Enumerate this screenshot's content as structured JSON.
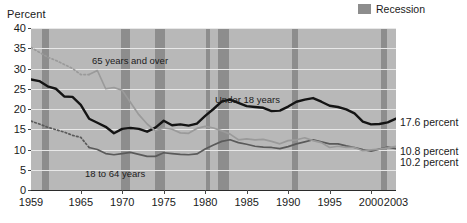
{
  "axis_title": "Percent",
  "legend": {
    "label": "Recession",
    "swatch_color": "#8d8d8d"
  },
  "colors": {
    "plot_background": "#b8b8b8",
    "recession_band": "#8d8d8d",
    "gridline": "#e8e8e8",
    "under18": "#141414",
    "age18to64": "#5a5a5a",
    "age65plus": "#9a9a9a"
  },
  "annotations": [
    {
      "name": "series-label-65-and-over",
      "text": "65 years and over"
    },
    {
      "name": "series-label-under-18",
      "text": "Under 18 years"
    },
    {
      "name": "series-label-18-to-64",
      "text": "18 to 64 years"
    }
  ],
  "end_labels": [
    {
      "name": "end-label-under-18",
      "text": "17.6 percent"
    },
    {
      "name": "end-label-65-and-over",
      "text": "10.8 percent"
    },
    {
      "name": "end-label-18-to-64",
      "text": "10.2 percent"
    }
  ],
  "chart_data": {
    "type": "line",
    "title": "",
    "xlabel": "",
    "ylabel": "Percent",
    "xlim": [
      1959,
      2003
    ],
    "ylim": [
      0,
      40
    ],
    "ytick_labels": [
      "0",
      "5",
      "10",
      "15",
      "20",
      "25",
      "30",
      "35",
      "40"
    ],
    "yticks": [
      0,
      5,
      10,
      15,
      20,
      25,
      30,
      35,
      40
    ],
    "xtick_labels": [
      "1959",
      "1965",
      "1970",
      "1975",
      "1980",
      "1985",
      "1990",
      "1995",
      "2000",
      "2003"
    ],
    "xticks": [
      1959,
      1965,
      1970,
      1975,
      1980,
      1985,
      1990,
      1995,
      2000,
      2003
    ],
    "grid": true,
    "legend_position": "top-right",
    "x": [
      1959,
      1960,
      1961,
      1962,
      1963,
      1964,
      1965,
      1966,
      1967,
      1968,
      1969,
      1970,
      1971,
      1972,
      1973,
      1974,
      1975,
      1976,
      1977,
      1978,
      1979,
      1980,
      1981,
      1982,
      1983,
      1984,
      1985,
      1986,
      1987,
      1988,
      1989,
      1990,
      1991,
      1992,
      1993,
      1994,
      1995,
      1996,
      1997,
      1998,
      1999,
      2000,
      2001,
      2002,
      2003
    ],
    "series": [
      {
        "name": "Under 18 years",
        "color": "#141414",
        "style": "solid",
        "final_value": 17.6,
        "values": [
          27.3,
          26.9,
          25.6,
          25.0,
          23.1,
          23.0,
          21.0,
          17.6,
          16.6,
          15.6,
          14.0,
          15.1,
          15.3,
          15.1,
          14.4,
          15.4,
          17.1,
          16.0,
          16.2,
          15.9,
          16.4,
          18.3,
          20.0,
          21.9,
          22.3,
          21.5,
          20.7,
          20.5,
          20.3,
          19.5,
          19.6,
          20.6,
          21.8,
          22.3,
          22.7,
          21.8,
          20.8,
          20.5,
          19.9,
          18.9,
          16.9,
          16.2,
          16.3,
          16.7,
          17.6
        ]
      },
      {
        "name": "18 to 64 years",
        "color": "#5a5a5a",
        "style": "dotted-then-solid",
        "dotted_until": 1966,
        "final_value": 10.2,
        "values": [
          17.0,
          16.3,
          15.5,
          14.9,
          14.3,
          13.5,
          13.0,
          10.5,
          10.0,
          9.0,
          8.7,
          9.0,
          9.3,
          8.8,
          8.3,
          8.3,
          9.2,
          9.0,
          8.8,
          8.7,
          8.9,
          10.1,
          11.1,
          12.0,
          12.4,
          11.7,
          11.3,
          10.8,
          10.6,
          10.5,
          10.2,
          10.7,
          11.4,
          11.9,
          12.4,
          11.9,
          11.4,
          11.4,
          10.9,
          10.5,
          10.0,
          9.6,
          10.1,
          10.6,
          10.2
        ]
      },
      {
        "name": "65 years and over",
        "color": "#9a9a9a",
        "style": "dotted-then-solid",
        "dotted_until": 1966,
        "final_value": 10.8,
        "values": [
          35.2,
          34.0,
          32.8,
          32.0,
          31.0,
          30.0,
          28.5,
          28.5,
          29.5,
          25.0,
          25.3,
          24.6,
          21.6,
          18.6,
          16.3,
          14.6,
          15.3,
          15.0,
          14.1,
          14.0,
          15.2,
          15.7,
          15.3,
          14.6,
          13.8,
          12.4,
          12.6,
          12.4,
          12.5,
          12.0,
          11.4,
          12.2,
          12.4,
          12.9,
          12.2,
          11.7,
          10.5,
          10.8,
          10.5,
          10.5,
          9.7,
          9.9,
          10.1,
          10.4,
          10.8
        ]
      }
    ],
    "recession_bands": [
      {
        "start": 1960.3,
        "end": 1961.2
      },
      {
        "start": 1969.9,
        "end": 1970.9
      },
      {
        "start": 1973.9,
        "end": 1975.2
      },
      {
        "start": 1980.1,
        "end": 1980.6
      },
      {
        "start": 1981.5,
        "end": 1982.9
      },
      {
        "start": 1990.5,
        "end": 1991.2
      },
      {
        "start": 2001.2,
        "end": 2001.9
      }
    ]
  }
}
